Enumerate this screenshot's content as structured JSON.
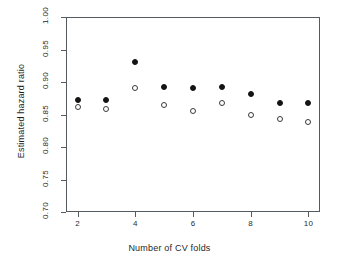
{
  "chart_data": {
    "type": "scatter",
    "title": "",
    "xlabel": "Number of CV folds",
    "ylabel": "Estimated hazard ratio",
    "x": [
      2,
      3,
      4,
      5,
      6,
      7,
      8,
      9,
      10
    ],
    "xlim": [
      1.6,
      10.4
    ],
    "ylim": [
      0.7,
      1.0
    ],
    "xticks": [
      "2",
      "4",
      "6",
      "8",
      "10"
    ],
    "xtick_values": [
      2,
      4,
      6,
      8,
      10
    ],
    "yticks": [
      "0.70",
      "0.75",
      "0.80",
      "0.85",
      "0.90",
      "0.95",
      "1.00"
    ],
    "ytick_values": [
      0.7,
      0.75,
      0.8,
      0.85,
      0.9,
      0.95,
      1.0
    ],
    "grid": false,
    "legend": "none",
    "series": [
      {
        "name": "filled-circles",
        "marker": "filled-circle",
        "color": "#141414",
        "values": [
          0.872,
          0.872,
          0.931,
          0.893,
          0.891,
          0.892,
          0.882,
          0.868,
          0.867
        ]
      },
      {
        "name": "open-circles",
        "marker": "open-circle",
        "color": "#3a3a3a",
        "values": [
          0.862,
          0.858,
          0.891,
          0.864,
          0.856,
          0.868,
          0.85,
          0.843,
          0.839
        ]
      }
    ]
  }
}
